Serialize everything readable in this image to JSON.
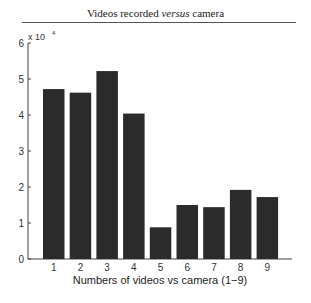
{
  "header": {
    "title_parts": [
      "Videos recorded ",
      "versus",
      " camera"
    ]
  },
  "axis": {
    "multiplier_base": "x 10",
    "multiplier_exp": "4"
  },
  "chart_data": {
    "type": "bar",
    "title": "Videos recorded versus camera",
    "xlabel": "Numbers of videos vs camera (1−9)",
    "ylabel": "",
    "y_scale_multiplier": 10000,
    "categories": [
      "1",
      "2",
      "3",
      "4",
      "5",
      "6",
      "7",
      "8",
      "9"
    ],
    "values": [
      47200,
      46200,
      52200,
      40400,
      8800,
      15000,
      14400,
      19200,
      17200
    ],
    "values_scaled": [
      4.72,
      4.62,
      5.22,
      4.04,
      0.88,
      1.5,
      1.44,
      1.92,
      1.72
    ],
    "yticks": [
      "0",
      "1",
      "2",
      "3",
      "4",
      "5",
      "6"
    ],
    "ylim": [
      0,
      60000
    ],
    "grid": false,
    "legend": null,
    "bar_color": "#2b2b2b"
  }
}
